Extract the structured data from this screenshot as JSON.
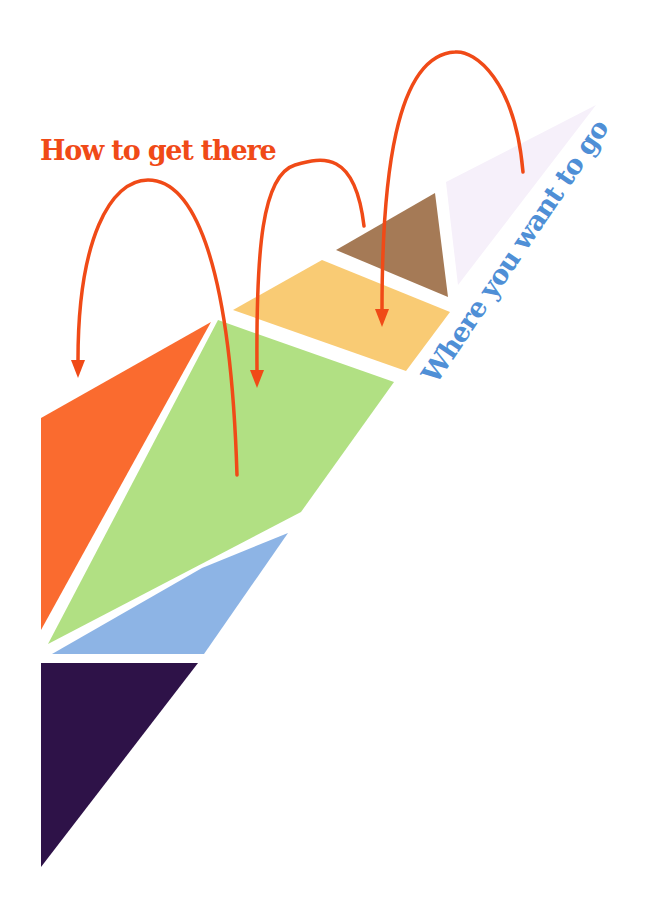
{
  "diagram": {
    "type": "tangram-progression",
    "labels": {
      "start": "How to get there",
      "goal": "Where you want to go"
    },
    "colors": {
      "accent_orange": "#f04a17",
      "label_blue": "#4f8fd6",
      "background": "#ffffff"
    },
    "pieces": [
      {
        "id": "dark-purple-triangle",
        "color": "#2e1248",
        "points": "41,663 198,663 41,867"
      },
      {
        "id": "blue-parallelogram",
        "color": "#8db4e5",
        "points": "52,654 204,654 288,533 202,568"
      },
      {
        "id": "orange-triangle",
        "color": "#fa6b2f",
        "points": "41,418 211,322 41,630"
      },
      {
        "id": "green-quad",
        "color": "#b1e083",
        "points": "218,320 394,382 301,512 48,644"
      },
      {
        "id": "yellow-parallelogram",
        "color": "#f9cb74",
        "points": "233,310 322,260 450,312 406,371"
      },
      {
        "id": "brown-triangle",
        "color": "#a57a56",
        "points": "336,250 435,193 448,297"
      },
      {
        "id": "lavender-triangle",
        "color": "#f6f0fa",
        "points": "446,182 596,105 458,285"
      }
    ],
    "arrows": [
      {
        "id": "arrow-to-orange",
        "path": "M 237 475 C 230 250 190 180 148 180 C 110 180 78 240 78 360",
        "head": "78,378 71,360 85,360"
      },
      {
        "id": "arrow-to-green",
        "path": "M 364 226 C 355 150 322 157 295 165 C 262 175 256 250 257 370",
        "head": "257,388 250,370 264,370"
      },
      {
        "id": "arrow-to-yellow",
        "path": "M 523 172 C 515 80 475 50 455 52 C 395 55 382 180 382 310",
        "head": "382,327 375,309 389,309"
      }
    ]
  }
}
